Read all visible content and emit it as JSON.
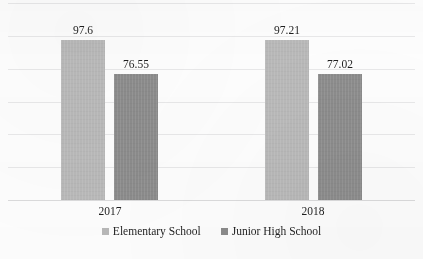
{
  "chart_data": {
    "type": "bar",
    "title": "",
    "subtitle": "",
    "xlabel": "",
    "ylabel": "",
    "categories": [
      "2017",
      "2018"
    ],
    "series": [
      {
        "name": "Elementary School",
        "values": [
          97.6,
          97.21
        ],
        "color": "#b9b9b9"
      },
      {
        "name": "Junior High School",
        "values": [
          76.55,
          77.02
        ],
        "color": "#8c8c8c"
      }
    ],
    "data_labels": [
      "97.6",
      "76.55",
      "97.21",
      "77.02"
    ],
    "ylim": [
      0,
      120
    ],
    "y_gridline_values": [
      120,
      100,
      80,
      60,
      40,
      20,
      0
    ],
    "grid": true,
    "y_axis_visible": false,
    "y_tick_labels_visible": false,
    "legend": {
      "position": "bottom",
      "entries": [
        {
          "label": "Elementary School",
          "color": "#b9b9b9"
        },
        {
          "label": "Junior High School",
          "color": "#8c8c8c"
        }
      ]
    },
    "background_color": "#ffffff",
    "gridline_color": "#e9e9ea",
    "text_color": "#1f1f1f"
  }
}
